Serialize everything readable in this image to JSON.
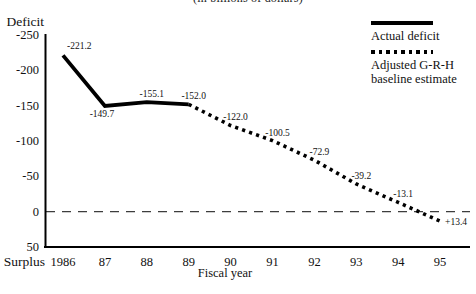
{
  "title": "(in billions of dollars)",
  "chart_data": {
    "type": "line",
    "title": "(in billions of dollars)",
    "xlabel": "Fiscal year",
    "y_axis_top_label": "Deficit",
    "y_axis_bottom_label": "Surplus",
    "categories": [
      "1986",
      "87",
      "88",
      "89",
      "90",
      "91",
      "92",
      "93",
      "94",
      "95"
    ],
    "y_ticks": [
      -250,
      -200,
      -150,
      -100,
      -50,
      0,
      50
    ],
    "ylim": [
      -250,
      50
    ],
    "y_axis_inverted": true,
    "grid": false,
    "zero_line_style": "dashed",
    "legend_position": "top-right",
    "colors": {
      "line": "#000000",
      "text": "#111111",
      "zero_line": "#3d3d3d"
    },
    "series": [
      {
        "name": "Actual deficit",
        "style": "solid",
        "points": [
          {
            "x": "1986",
            "v": -221.2,
            "label": "-221.2",
            "label_pos": "above-right"
          },
          {
            "x": "87",
            "v": -149.7,
            "label": "-149.7",
            "label_pos": "below"
          },
          {
            "x": "88",
            "v": -155.1,
            "label": "-155.1",
            "label_pos": "above"
          },
          {
            "x": "89",
            "v": -152.0,
            "label": "-152.0",
            "label_pos": "above"
          }
        ]
      },
      {
        "name": "Adjusted G-R-H baseline estimate",
        "style": "dotted",
        "points": [
          {
            "x": "89",
            "v": -152.0,
            "label": "",
            "label_pos": "above"
          },
          {
            "x": "90",
            "v": -122.0,
            "label": "-122.0",
            "label_pos": "above"
          },
          {
            "x": "91",
            "v": -100.5,
            "label": "-100.5",
            "label_pos": "above"
          },
          {
            "x": "92",
            "v": -72.9,
            "label": "-72.9",
            "label_pos": "above"
          },
          {
            "x": "93",
            "v": -39.2,
            "label": "-39.2",
            "label_pos": "above"
          },
          {
            "x": "94",
            "v": -13.1,
            "label": "-13.1",
            "label_pos": "above"
          },
          {
            "x": "95",
            "v": 13.4,
            "label": "+13.4",
            "label_pos": "right-below"
          }
        ]
      }
    ]
  }
}
